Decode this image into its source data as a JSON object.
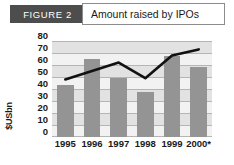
{
  "header": {
    "figure_tag": "FIGURE 2",
    "title": "Amount raised by IPOs"
  },
  "chart_data": {
    "type": "bar",
    "title": "Amount raised by IPOs",
    "xlabel": "",
    "ylabel": "$USbn",
    "categories": [
      "1995",
      "1996",
      "1997",
      "1998",
      "1999",
      "2000*"
    ],
    "ylim": [
      0,
      80
    ],
    "yticks": [
      80,
      70,
      60,
      50,
      40,
      30,
      20,
      10,
      0
    ],
    "grid": true,
    "legend": "none",
    "series": [
      {
        "name": "Amount raised",
        "type": "bar",
        "values": [
          43,
          65,
          49,
          37,
          67,
          58
        ]
      },
      {
        "name": "Trend",
        "type": "line",
        "values": [
          48,
          55,
          62,
          49,
          68,
          73
        ]
      }
    ],
    "colors": {
      "bar": "#949494",
      "line": "#111111",
      "plot_background": "#f2f2f2",
      "band": "#e2e2e2",
      "gridline": "#b5b5b5",
      "tag_background": "#4d4d4d"
    }
  }
}
